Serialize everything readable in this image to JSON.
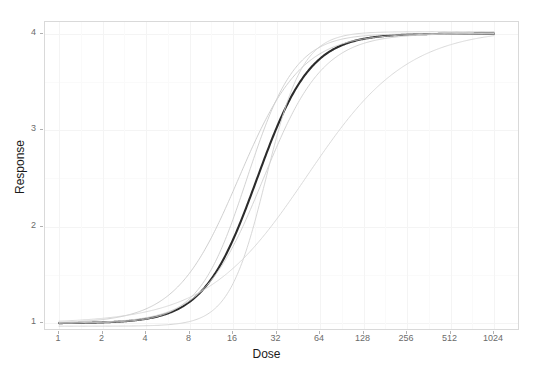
{
  "chart_data": {
    "type": "line",
    "title": "",
    "xlabel": "Dose",
    "ylabel": "Response",
    "xscale": "log2",
    "xlim": [
      1,
      1024
    ],
    "ylim": [
      0.92,
      4.12
    ],
    "xticks": [
      1,
      2,
      4,
      8,
      16,
      32,
      64,
      128,
      256,
      512,
      1024
    ],
    "xtick_labels": [
      "1",
      "2",
      "4",
      "8",
      "16",
      "32",
      "64",
      "128",
      "256",
      "512",
      "1024"
    ],
    "yticks": [
      1,
      2,
      3,
      4
    ],
    "ytick_labels": [
      "1",
      "2",
      "3",
      "4"
    ],
    "grid": true,
    "legend": "none",
    "model": "four-parameter log-logistic sigmoid: y = bottom + (top - bottom) / (1 + (ED50/x)^slope)",
    "series": [
      {
        "name": "fitted-mean-curve",
        "role": "primary",
        "color": "#2b2b2b",
        "width": 2.1,
        "bottom": 1.0,
        "top": 4.0,
        "ed50": 23.5,
        "slope": 2.35,
        "x": [
          1,
          2,
          4,
          8,
          11,
          16,
          22,
          23.5,
          32,
          45,
          64,
          90,
          128,
          181,
          256,
          362,
          512,
          724,
          1024
        ],
        "y": [
          1.01,
          1.02,
          1.08,
          1.26,
          1.45,
          1.85,
          2.44,
          2.5,
          3.03,
          3.45,
          3.68,
          3.82,
          3.9,
          3.94,
          3.97,
          3.98,
          3.99,
          3.99,
          4.0
        ]
      },
      {
        "name": "bootstrap-curve-1",
        "role": "uncertainty",
        "color": "#c9c9c9",
        "width": 0.9,
        "bottom": 1.0,
        "top": 4.0,
        "ed50": 17.5,
        "slope": 2.0,
        "x": [
          1,
          2,
          4,
          8,
          16,
          32,
          64,
          128,
          256,
          512,
          1024
        ],
        "y": [
          1.01,
          1.03,
          1.13,
          1.42,
          2.31,
          3.25,
          3.7,
          3.89,
          3.96,
          3.98,
          3.99
        ]
      },
      {
        "name": "bootstrap-curve-2",
        "role": "uncertainty",
        "color": "#cdcdcd",
        "width": 0.9,
        "bottom": 1.0,
        "top": 4.0,
        "ed50": 20.0,
        "slope": 2.6,
        "x": [
          1,
          2,
          4,
          8,
          16,
          32,
          64,
          128,
          256,
          512,
          1024
        ],
        "y": [
          1.0,
          1.01,
          1.05,
          1.22,
          1.97,
          3.33,
          3.78,
          3.93,
          3.97,
          3.99,
          4.0
        ]
      },
      {
        "name": "bootstrap-curve-3",
        "role": "uncertainty",
        "color": "#d2d2d2",
        "width": 0.9,
        "bottom": 0.97,
        "top": 4.02,
        "ed50": 27.0,
        "slope": 3.4,
        "x": [
          1,
          2,
          4,
          8,
          16,
          32,
          64,
          128,
          256,
          512,
          1024
        ],
        "y": [
          0.97,
          0.97,
          0.98,
          1.04,
          1.46,
          2.84,
          3.74,
          3.95,
          4.0,
          4.01,
          4.02
        ]
      },
      {
        "name": "bootstrap-curve-4",
        "role": "uncertainty",
        "color": "#cfcfcf",
        "width": 0.9,
        "bottom": 1.0,
        "top": 4.0,
        "ed50": 26.0,
        "slope": 2.1,
        "x": [
          1,
          2,
          4,
          8,
          16,
          32,
          64,
          128,
          256,
          512,
          1024
        ],
        "y": [
          1.01,
          1.03,
          1.1,
          1.31,
          1.91,
          2.91,
          3.5,
          3.79,
          3.91,
          3.96,
          3.98
        ]
      },
      {
        "name": "bootstrap-curve-5",
        "role": "uncertainty",
        "color": "#d6d6d6",
        "width": 0.9,
        "bottom": 1.0,
        "top": 4.05,
        "ed50": 52.0,
        "slope": 1.25,
        "x": [
          1,
          2,
          4,
          8,
          16,
          32,
          64,
          128,
          256,
          512,
          1024
        ],
        "y": [
          1.03,
          1.06,
          1.14,
          1.31,
          1.68,
          2.31,
          3.05,
          3.54,
          3.81,
          3.93,
          3.97
        ]
      }
    ]
  },
  "axes": {
    "x_title": "Dose",
    "y_title": "Response"
  },
  "colors": {
    "panel_background": "#ffffff",
    "panel_border": "#d9d9d9",
    "grid_major": "#f4f4f4",
    "grid_minor": "#fafafa",
    "tick_text": "#6b6b6b",
    "axis_title": "#1a1a1a",
    "primary_curve": "#2b2b2b",
    "uncertainty_curve": "#cccccc"
  }
}
